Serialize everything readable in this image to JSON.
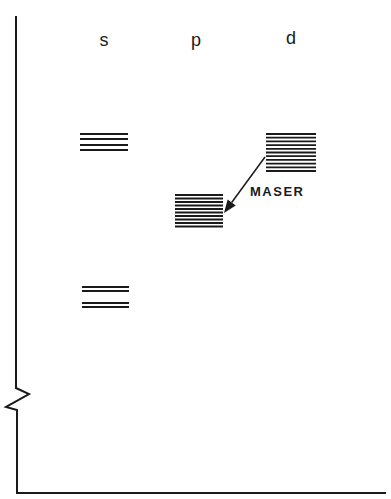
{
  "diagram": {
    "type": "energy-level diagram",
    "columns": [
      {
        "label": "s",
        "x": 104
      },
      {
        "label": "p",
        "x": 198
      },
      {
        "label": "d",
        "x": 292
      }
    ],
    "levels": [
      {
        "column": "s",
        "name": "s-upper",
        "x1": 80,
        "x2": 128,
        "lines_y": [
          134,
          139,
          145,
          150
        ]
      },
      {
        "column": "s",
        "name": "s-lower",
        "x1": 82,
        "x2": 129,
        "lines_y": [
          287,
          291,
          303,
          307
        ]
      },
      {
        "column": "p",
        "name": "p-level",
        "x1": 175,
        "x2": 223,
        "lines_y": [
          195,
          198.5,
          202,
          205.5,
          209,
          212.5,
          216,
          219.5,
          223,
          226.5
        ]
      },
      {
        "column": "d",
        "name": "d-level",
        "x1": 266,
        "x2": 316,
        "lines_y": [
          134,
          137.7,
          141.4,
          145.1,
          148.8,
          152.5,
          156.2,
          159.9,
          163.6,
          167.3,
          171
        ]
      }
    ],
    "arrow": {
      "from": [
        265,
        157
      ],
      "to": [
        224,
        213
      ],
      "label": "MASER"
    },
    "annotation": {
      "text": "MASER",
      "x": 250,
      "y": 184
    },
    "axes": {
      "vertical": {
        "x": 16,
        "y_top": 16,
        "y_bottom": 493,
        "break": true
      },
      "horizontal": {
        "y": 493,
        "x_left": 16,
        "x_right": 386
      }
    },
    "colors": {
      "line": "#1a1a1a",
      "background": "#ffffff"
    }
  }
}
